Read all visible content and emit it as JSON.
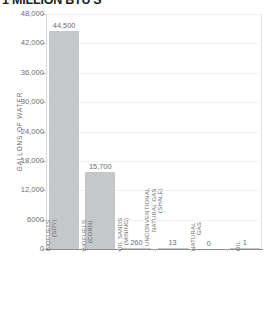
{
  "chart_data": {
    "type": "bar",
    "title": "1 MILLION BTU'S",
    "xlabel": "",
    "ylabel": "GALLONS OF WATER",
    "ylim": [
      0,
      48000
    ],
    "grid": true,
    "legend": "none",
    "categories": [
      "BIOFUELS (SOY)",
      "BIOFUELS (CORN)",
      "OIL SANDS (MINING)",
      "UNCONVENTIONAL NATURAL GAS (SHALE)",
      "NATURAL GAS",
      "OIL"
    ],
    "category_lines": [
      "BIOFUELS\n(SOY)",
      "BIOFUELS\n(CORN)",
      "OIL SANDS\n(MINING)",
      "UNCONVENTIONAL\nNATURAL GAS (SHALE)",
      "NATURAL\nGAS",
      "OIL"
    ],
    "values": [
      44500,
      15700,
      260,
      13,
      0,
      1
    ],
    "value_labels": [
      "44,500",
      "15,700",
      "260",
      "13",
      "0",
      "1"
    ],
    "y_ticks": [
      48000,
      42000,
      36000,
      30000,
      24000,
      18000,
      12000,
      6000,
      0
    ],
    "y_tick_labels": [
      "48,000",
      "42,000",
      "36,000",
      "30,000",
      "24,000",
      "18,000",
      "12,000",
      "6000",
      "0"
    ],
    "bar_color": "#c6c7c9",
    "axis_color": "#8c8c8c",
    "text_color": "#6d6e71",
    "title_color": "#231f20"
  }
}
